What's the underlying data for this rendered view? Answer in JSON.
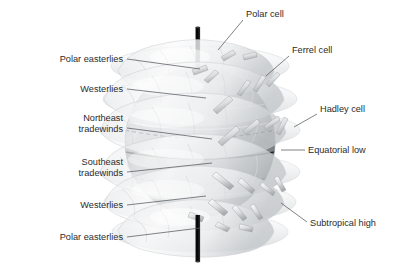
{
  "diagram": {
    "background_color": "#ffffff",
    "text_color": "#2b2b2b",
    "leader_color": "#555a5e",
    "globe": {
      "center_x": 200,
      "center_y": 142,
      "radius": 75,
      "surface_color": "#9ea3a6",
      "axis_color": "#0b0b0b",
      "equator_label": "equator-line",
      "tropic_line_style": "dashed"
    },
    "cell_color": "#f2f3f4",
    "arrow_color": "#d8dadb"
  },
  "labels_left": [
    {
      "id": "polar-easterlies-north",
      "text": "Polar easterlies",
      "x": 123,
      "y": 62,
      "leader_x2": 200,
      "leader_y2": 70
    },
    {
      "id": "westerlies-north",
      "text": "Westerlies",
      "x": 123,
      "y": 92,
      "leader_x2": 205,
      "leader_y2": 99
    },
    {
      "id": "northeast-tradewinds",
      "text": "Northeast",
      "text2": "tradewinds",
      "x": 123,
      "y": 121,
      "leader_x2": 210,
      "leader_y2": 131
    },
    {
      "id": "southeast-tradewinds",
      "text": "Southeast",
      "text2": "tradewinds",
      "x": 123,
      "y": 165,
      "leader_x2": 210,
      "leader_y2": 175
    },
    {
      "id": "westerlies-south",
      "text": "Westerlies",
      "x": 123,
      "y": 208,
      "leader_x2": 205,
      "leader_y2": 201
    },
    {
      "id": "polar-easterlies-south",
      "text": "Polar easterlies",
      "x": 123,
      "y": 240,
      "leader_x2": 200,
      "leader_y2": 228
    }
  ],
  "labels_right": [
    {
      "id": "polar-cell",
      "text": "Polar cell",
      "x": 246,
      "y": 17,
      "leader_x2": 218,
      "leader_y2": 50
    },
    {
      "id": "ferrel-cell",
      "text": "Ferrel cell",
      "x": 292,
      "y": 53,
      "leader_x2": 264,
      "leader_y2": 76
    },
    {
      "id": "hadley-cell",
      "text": "Hadley cell",
      "x": 320,
      "y": 112,
      "leader_x2": 294,
      "leader_y2": 126
    },
    {
      "id": "equatorial-low",
      "text": "Equatorial low",
      "x": 308,
      "y": 153,
      "leader_x2": 282,
      "leader_y2": 153
    },
    {
      "id": "subtropical-high",
      "text": "Subtropical high",
      "x": 310,
      "y": 226,
      "leader_x2": 278,
      "leader_y2": 206
    }
  ],
  "cells": [
    {
      "id": "polar-cell-north",
      "lat_center": 75,
      "name": "Polar cell (N)"
    },
    {
      "id": "ferrel-cell-north",
      "lat_center": 45,
      "name": "Ferrel cell (N)"
    },
    {
      "id": "hadley-cell-north",
      "lat_center": 15,
      "name": "Hadley cell (N)"
    },
    {
      "id": "hadley-cell-south",
      "lat_center": -15,
      "name": "Hadley cell (S)"
    },
    {
      "id": "ferrel-cell-south",
      "lat_center": -45,
      "name": "Ferrel cell (S)"
    },
    {
      "id": "polar-cell-south",
      "lat_center": -75,
      "name": "Polar cell (S)"
    }
  ],
  "latitude_lines": [
    {
      "id": "lat-60n",
      "lat": 60,
      "style": "solid-light"
    },
    {
      "id": "lat-30n",
      "lat": 30,
      "style": "solid-light"
    },
    {
      "id": "tropic-cancer",
      "lat": 20,
      "style": "dashed"
    },
    {
      "id": "equator",
      "lat": 0,
      "style": "solid-dark"
    },
    {
      "id": "tropic-capricorn",
      "lat": -20,
      "style": "dashed"
    },
    {
      "id": "lat-30s",
      "lat": -30,
      "style": "solid-light"
    },
    {
      "id": "lat-60s",
      "lat": -60,
      "style": "solid-light"
    }
  ]
}
